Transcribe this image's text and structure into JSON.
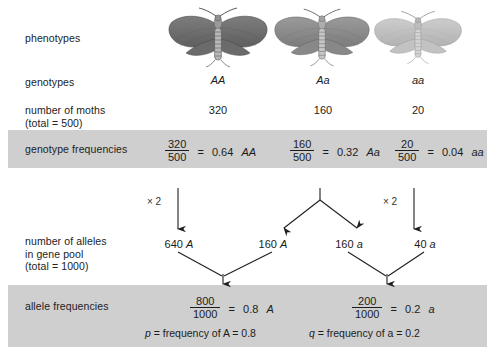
{
  "diagram": {
    "rows": {
      "phenotypes_label": "phenotypes",
      "genotypes_label": "genotypes",
      "moths_label": "number of moths\n(total = 500)",
      "genotype_freq_label": "genotype frequencies",
      "alleles_label": "number of alleles\nin gene pool\n(total = 1000)",
      "allele_freq_label": "allele frequencies"
    },
    "columns": [
      {
        "genotype": "AA",
        "count": "320",
        "moth_shade": "#6e6e6e",
        "frequency": {
          "numerator": "320",
          "denominator": "500",
          "equals": "=",
          "result": "0.64",
          "genotype": "AA"
        }
      },
      {
        "genotype": "Aa",
        "count": "160",
        "moth_shade": "#8d8d8d",
        "frequency": {
          "numerator": "160",
          "denominator": "500",
          "equals": "=",
          "result": "0.32",
          "genotype": "Aa"
        }
      },
      {
        "genotype": "aa",
        "count": "20",
        "moth_shade": "#c2c2c2",
        "frequency": {
          "numerator": "20",
          "denominator": "500",
          "equals": "=",
          "result": "0.04",
          "genotype": "aa"
        }
      }
    ],
    "multipliers": {
      "left": "× 2",
      "right": "× 2"
    },
    "alleles": [
      {
        "count": "640",
        "allele": "A"
      },
      {
        "count": "160",
        "allele": "A"
      },
      {
        "count": "160",
        "allele": "a"
      },
      {
        "count": "40",
        "allele": "a"
      }
    ],
    "allele_frequencies": [
      {
        "numerator": "800",
        "denominator": "1000",
        "equals": "=",
        "result": "0.8",
        "allele": "A",
        "statement_symbol": "p",
        "statement": "= frequency of A = 0.8"
      },
      {
        "numerator": "200",
        "denominator": "1000",
        "equals": "=",
        "result": "0.2",
        "allele": "a",
        "statement_symbol": "q",
        "statement": "= frequency of a = 0.2"
      }
    ],
    "colors": {
      "band": "#cfcfcf",
      "text": "#1c1c1c",
      "arrow": "#2a2a2a",
      "background": "#ffffff"
    }
  }
}
